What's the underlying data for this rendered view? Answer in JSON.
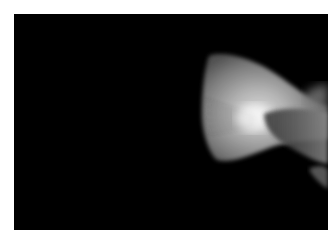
{
  "image": {
    "alt": "Close-up of a translucent fish tail fin glowing white against a black background",
    "subject": "fish-tail-fin",
    "colors": {
      "background": "#000000",
      "border": "#ffffff",
      "fin_highlight": "#e8e8e8",
      "fin_mid": "#9a9a9a",
      "body_shadow": "#3a3a3a"
    }
  }
}
